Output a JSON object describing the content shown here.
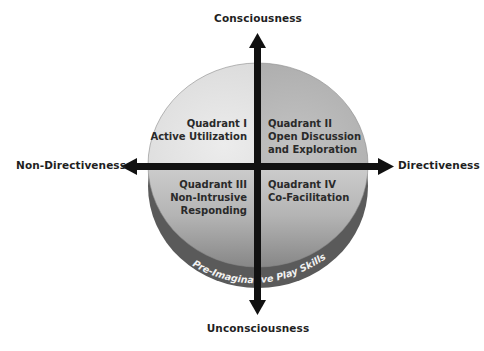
{
  "axes": {
    "top": "Consciousness",
    "bottom": "Unconsciousness",
    "left": "Non-Directiveness",
    "right": "Directiveness"
  },
  "quadrants": [
    {
      "id": "I",
      "title": "Quadrant I",
      "lines": [
        "Active Utilization"
      ],
      "position": "upper-left"
    },
    {
      "id": "II",
      "title": "Quadrant II",
      "lines": [
        "Open Discussion",
        "and Exploration"
      ],
      "position": "upper-right"
    },
    {
      "id": "III",
      "title": "Quadrant III",
      "lines": [
        "Non-Intrusive",
        "Responding"
      ],
      "position": "lower-left"
    },
    {
      "id": "IV",
      "title": "Quadrant IV",
      "lines": [
        "Co-Facilitation"
      ],
      "position": "lower-right"
    }
  ],
  "base_band": "Pre-Imaginative Play Skills",
  "colors": {
    "quadrant_I": "#e2e2e2",
    "quadrant_II": "#b9b9b9",
    "lower_face_top": "#c8c8c8",
    "lower_face_bottom": "#8a8a8a",
    "rim": "#555555",
    "arrow": "#111111",
    "text": "#1f1f1f"
  }
}
